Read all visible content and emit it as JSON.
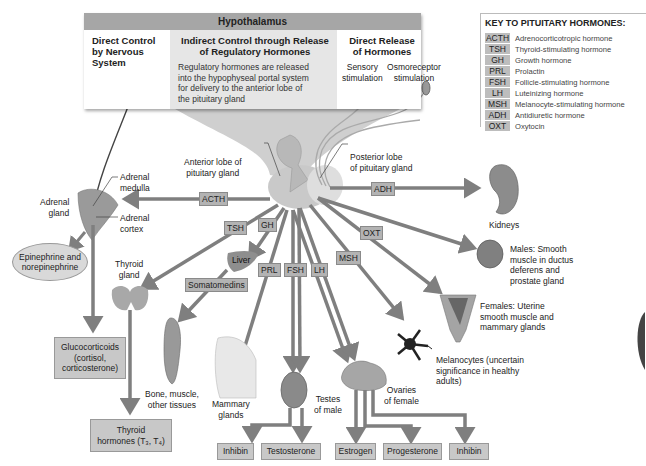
{
  "hypothalamus": {
    "title": "Hypothalamus",
    "columns": [
      {
        "heading_lines": [
          "Direct Control",
          "by Nervous",
          "System"
        ]
      },
      {
        "heading_lines": [
          "Indirect Control through Release",
          "of Regulatory Hormones"
        ],
        "body_lines": [
          "Regulatory hormones are released",
          "into the hypophyseal portal system",
          "for delivery to the anterior lobe of",
          "the pituitary gland"
        ]
      },
      {
        "heading_lines": [
          "Direct Release",
          "of Hormones"
        ],
        "stimuli": [
          {
            "lines": [
              "Sensory",
              "stimulation"
            ]
          },
          {
            "lines": [
              "Osmoreceptor",
              "stimulation"
            ]
          }
        ]
      }
    ]
  },
  "key": {
    "title": "KEY TO PITUITARY HORMONES:",
    "items": [
      {
        "abbr": "ACTH",
        "name": "Adrenocorticotropic hormone"
      },
      {
        "abbr": "TSH",
        "name": "Thyroid-stimulating hormone"
      },
      {
        "abbr": "GH",
        "name": "Growth hormone"
      },
      {
        "abbr": "PRL",
        "name": "Prolactin"
      },
      {
        "abbr": "FSH",
        "name": "Follicle-stimulating hormone"
      },
      {
        "abbr": "LH",
        "name": "Luteinizing hormone"
      },
      {
        "abbr": "MSH",
        "name": "Melanocyte-stimulating hormone"
      },
      {
        "abbr": "ADH",
        "name": "Antidiuretic hormone"
      },
      {
        "abbr": "OXT",
        "name": "Oxytocin"
      }
    ]
  },
  "pituitary": {
    "anterior_label": [
      "Anterior lobe of",
      "pituitary gland"
    ],
    "posterior_label": [
      "Posterior lobe",
      "of pituitary gland"
    ]
  },
  "hormone_tags": {
    "acth": "ACTH",
    "tsh": "TSH",
    "gh": "GH",
    "prl": "PRL",
    "fsh": "FSH",
    "lh": "LH",
    "msh": "MSH",
    "adh": "ADH",
    "oxt": "OXT",
    "somatomedins": "Somatomedins"
  },
  "targets": {
    "adrenal_gland": [
      "Adrenal",
      "gland"
    ],
    "adrenal_medulla": [
      "Adrenal",
      "medulla"
    ],
    "adrenal_cortex": [
      "Adrenal",
      "cortex"
    ],
    "thyroid_gland": [
      "Thyroid",
      "gland"
    ],
    "liver": "Liver",
    "bone_muscle": [
      "Bone, muscle,",
      "other tissues"
    ],
    "mammary": [
      "Mammary",
      "glands"
    ],
    "testes": [
      "Testes",
      "of male"
    ],
    "ovaries": [
      "Ovaries",
      "of female"
    ],
    "kidneys": "Kidneys",
    "males": [
      "Males: Smooth",
      "muscle in ductus",
      "deferens and",
      "prostate gland"
    ],
    "females": [
      "Females: Uterine",
      "smooth muscle and",
      "mammary glands"
    ],
    "melanocytes": [
      "Melanocytes (uncertain",
      "significance in healthy",
      "adults)"
    ]
  },
  "outputs": {
    "epinephrine": [
      "Epinephrine and",
      "norepinephrine"
    ],
    "glucocorticoids": [
      "Glucocorticoids",
      "(cortisol,",
      "corticosterone)"
    ],
    "thyroid_hormones": [
      "Thyroid",
      "hormones (T₃, T₄)"
    ],
    "inhibin_male": "Inhibin",
    "testosterone": "Testosterone",
    "estrogen": "Estrogen",
    "progesterone": "Progesterone",
    "inhibin_female": "Inhibin"
  },
  "colors": {
    "arrow": "#7f7f7f",
    "tag_bg": "#b3b3b3",
    "panel_header": "#a6a6a6",
    "panel_mid": "#e6e6e6",
    "output_bg": "#c8c8c8"
  }
}
